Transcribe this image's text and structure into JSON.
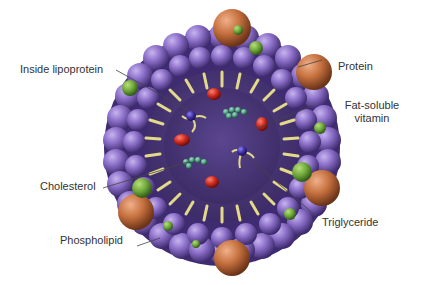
{
  "diagram": {
    "colors": {
      "shell_phospholipid": "#8a6fc4",
      "shell_dark": "#4a3580",
      "core": "#4e3a7c",
      "protein": "#c8744a",
      "cholesterol": "#6fa83a",
      "tails": "#e3d98a",
      "red_molecule": "#c8261e",
      "teal_molecule": "#4f9a82",
      "triglyceride_head": "#3a2aa0"
    },
    "labels": {
      "inside_lipoprotein": "Inside lipoprotein",
      "protein": "Protein",
      "fat_soluble_vitamin_line1": "Fat-soluble",
      "fat_soluble_vitamin_line2": "vitamin",
      "cholesterol": "Cholesterol",
      "phospholipid": "Phospholipid",
      "triglyceride": "Triglyceride"
    }
  }
}
